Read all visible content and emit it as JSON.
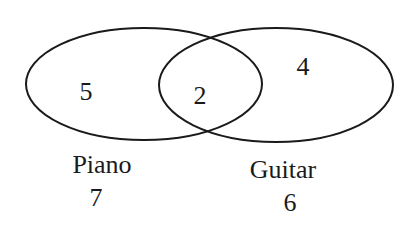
{
  "diagram": {
    "type": "venn",
    "sets": [
      {
        "name": "Piano",
        "total": "7",
        "only": "5"
      },
      {
        "name": "Guitar",
        "total": "6",
        "only": "4"
      }
    ],
    "intersection": "2",
    "stroke_color": "#1a1a1a"
  }
}
